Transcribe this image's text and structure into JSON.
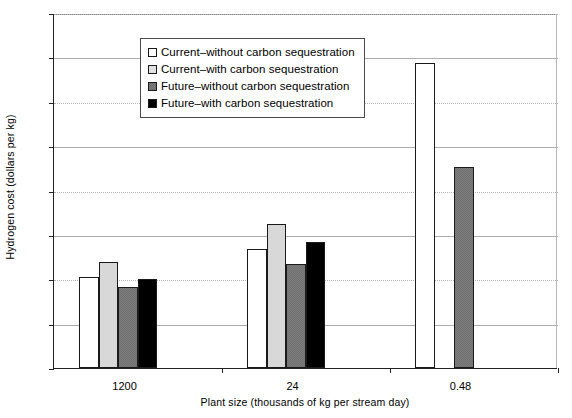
{
  "chart_data": {
    "type": "bar",
    "title": "",
    "xlabel": "Plant size (thousands of kg per stream day)",
    "ylabel": "Hydrogen cost (dollars per kg)",
    "categories": [
      "1200",
      "24",
      "0.48"
    ],
    "ylim": [
      0,
      4
    ],
    "yticks": [
      "0",
      "0.5",
      "1",
      "1.5",
      "2",
      "2.5",
      "3",
      "3.5",
      "4"
    ],
    "ytick_values": [
      0,
      0.5,
      1,
      1.5,
      2,
      2.5,
      3,
      3.5,
      4
    ],
    "grid": true,
    "legend_position": "upper-left-inside",
    "series": [
      {
        "name": "Current–without carbon sequestration",
        "color": "#ffffff",
        "values": [
          1.02,
          1.34,
          3.44
        ]
      },
      {
        "name": "Current–with carbon sequestration",
        "color": "#d8d8d8",
        "values": [
          1.2,
          1.62,
          null
        ]
      },
      {
        "name": "Future–without carbon sequestration",
        "color": "#7d7d7d",
        "values": [
          0.91,
          1.17,
          2.26
        ]
      },
      {
        "name": "Future–with carbon sequestration",
        "color": "#000000",
        "values": [
          1.0,
          1.42,
          null
        ]
      }
    ]
  },
  "axes": {
    "y_title": "Hydrogen cost (dollars per kg)",
    "x_title": "Plant size (thousands of kg per stream day)"
  },
  "legend": {
    "entries": [
      "Current–without carbon sequestration",
      "Current–with carbon sequestration",
      "Future–without carbon sequestration",
      "Future–with carbon sequestration"
    ]
  }
}
